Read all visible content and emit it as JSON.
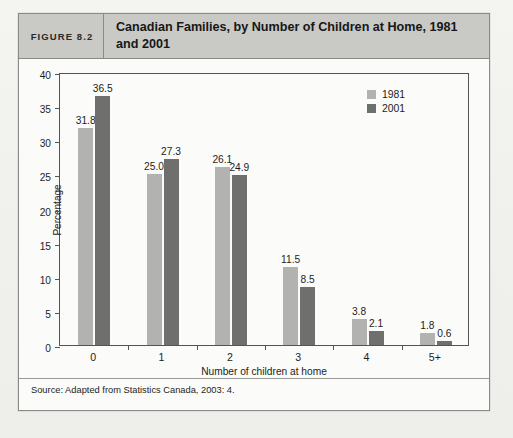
{
  "figure": {
    "number_label": "FIGURE 8.2",
    "title": "Canadian Families, by Number of Children at Home, 1981 and 2001",
    "source": "Source: Adapted from Statistics Canada, 2003: 4."
  },
  "chart_data": {
    "type": "bar",
    "title": "Canadian Families, by Number of Children at Home, 1981 and 2001",
    "xlabel": "Number of children at home",
    "ylabel": "Percentage",
    "categories": [
      "0",
      "1",
      "2",
      "3",
      "4",
      "5+"
    ],
    "series": [
      {
        "name": "1981",
        "color": "#b2b2b0",
        "values": [
          31.8,
          25.0,
          26.1,
          11.5,
          3.8,
          1.8
        ]
      },
      {
        "name": "2001",
        "color": "#6f6f6d",
        "values": [
          36.5,
          27.3,
          24.9,
          8.5,
          2.1,
          0.6
        ]
      }
    ],
    "value_labels": {
      "1981": [
        "31.8",
        "25.0",
        "26.1",
        "11.5",
        "3.8",
        "1.8"
      ],
      "2001": [
        "36.5",
        "27.3",
        "24.9",
        "8.5",
        "2.1",
        "0.6"
      ]
    },
    "ylim": [
      0,
      40
    ],
    "yticks": [
      0,
      5,
      10,
      15,
      20,
      25,
      30,
      35,
      40
    ],
    "ytick_labels": [
      "0",
      "5",
      "10",
      "15",
      "20",
      "25",
      "30",
      "35",
      "40"
    ],
    "grid": false,
    "legend_position": "top-right",
    "legend": [
      "1981",
      "2001"
    ]
  }
}
